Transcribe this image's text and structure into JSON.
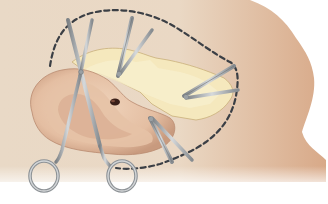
{
  "illustration": {
    "subject": "ear surgical procedure illustration",
    "elements": {
      "skin_background": "skin-area",
      "ear": "auricle",
      "exposed_tissue": "exposed cartilage flap",
      "incision_outline": "dashed incision line",
      "instruments": [
        "surgical scissors",
        "hemostat clamp (top)",
        "hemostat clamp (right)",
        "hemostat clamp (lower right)"
      ]
    },
    "colors": {
      "skin_light": "#ead8c3",
      "skin_dark": "#d9ab8c",
      "cartilage": "#f6eabf",
      "ear": "#e7c4a8",
      "ear_shadow": "#c99a7d",
      "dashed_line": "#3d4046",
      "steel": "#b8bcbf",
      "steel_dark": "#6e7377",
      "background": "#ffffff"
    }
  }
}
